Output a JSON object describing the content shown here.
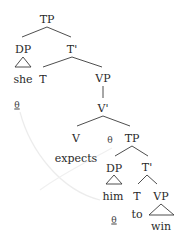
{
  "diagram": {
    "type": "syntax-tree",
    "colors": {
      "line": "#3a3a3a",
      "text": "#2a2a2a",
      "arrow": "#eeeeee"
    },
    "nodes": {
      "tp_root": "TP",
      "dp_subject": "DP",
      "she": "she",
      "t_bar_top": "T'",
      "t_top": "T",
      "vp_top": "VP",
      "v_bar": "V'",
      "v": "V",
      "expects": "expects",
      "tp_embedded": "TP",
      "dp_object": "DP",
      "him": "him",
      "t_bar_embedded": "T'",
      "t_embedded": "T",
      "to": "to",
      "vp_embedded": "VP",
      "win": "win"
    },
    "theta_marks": {
      "she_theta": "θ",
      "tp_theta": "θ",
      "him_theta": "θ"
    }
  }
}
